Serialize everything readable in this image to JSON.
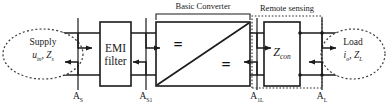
{
  "figure": {
    "type": "block-diagram"
  },
  "blocks": {
    "supply": {
      "name": "Supply",
      "line1": "Supply",
      "line2_main": "u",
      "line2_sub": "in",
      "line2_sep": ", ",
      "line2_main2": "Z",
      "line2_sub2": "s",
      "shape": "dashed-circle"
    },
    "emi_filter": {
      "line1": "EMI",
      "line2": "filter",
      "shape": "rect"
    },
    "converter": {
      "symbol_top": "=",
      "symbol_bottom": "=",
      "shape": "rect-with-diagonal"
    },
    "zcon": {
      "main": "Z",
      "sub": "con",
      "shape": "rect"
    },
    "load": {
      "line1": "Load",
      "line2_main": "i",
      "line2_sub": "o",
      "line2_sep": ", ",
      "line2_main2": "Z",
      "line2_sub2": "L",
      "shape": "dashed-circle"
    }
  },
  "annotations": {
    "basic_converter": "Basic Converter",
    "remote_sensing": "Remote sensing"
  },
  "measurement_points": [
    {
      "id": "as",
      "main": "A",
      "sub": "S"
    },
    {
      "id": "as1",
      "main": "A",
      "sub": "S1"
    },
    {
      "id": "a1l",
      "main": "A",
      "sub": "1L"
    },
    {
      "id": "al",
      "main": "A",
      "sub": "L"
    }
  ],
  "colors": {
    "line": "#1a1a1a",
    "text": "#1a1a1a",
    "background": "#ffffff",
    "dashed": "#333333"
  }
}
